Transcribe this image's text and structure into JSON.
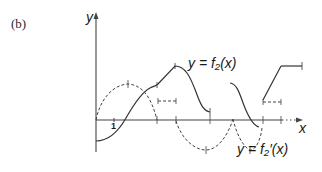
{
  "figure": {
    "panel_label": "(b)",
    "axes": {
      "y_label": "y",
      "x_label": "x",
      "tick_label": "1"
    },
    "curves": [
      {
        "name": "f2",
        "label": "y = f₂(x)",
        "style": "solid"
      },
      {
        "name": "f2-derivative",
        "label": "y = f₂′(x)",
        "style": "dashed"
      }
    ],
    "colors": {
      "ink": "#333333",
      "background": "#ffffff"
    }
  }
}
